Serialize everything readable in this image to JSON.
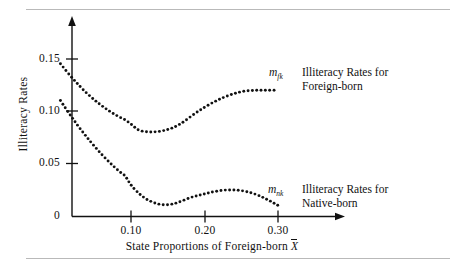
{
  "figure": {
    "background": "#ffffff",
    "ink_color": "#111111",
    "rule_color": "#b9b9b9",
    "top_rule": "divider-line",
    "bottom_rule": "divider-line"
  },
  "axes": {
    "x_tick_labels": [
      "0.10",
      "0.20",
      "0.30"
    ],
    "x_tick_values": [
      0.1,
      0.2,
      0.3
    ],
    "y_tick_labels": [
      "0",
      "0.05",
      "0.10",
      "0.15"
    ],
    "y_tick_values": [
      0,
      0.05,
      0.1,
      0.15
    ],
    "x_axis_title_prefix": "State Proportions of Foreign-born ",
    "x_axis_title_symbol": "X",
    "y_axis_title": "Illiteracy Rates",
    "x_arrow": "right-arrow-head",
    "y_arrow": "up-arrow-head"
  },
  "annotations": {
    "foreign": {
      "symbol_base": "m",
      "symbol_sub": "fk",
      "line1": "Illiteracy Rates for",
      "line2": "Foreign-born"
    },
    "native": {
      "symbol_base": "m",
      "symbol_sub": "nk",
      "line1": "Illiteracy Rates for",
      "line2": "Native-born"
    }
  },
  "chart_data": {
    "type": "line",
    "title": "",
    "subtitle": "",
    "xlabel": "State Proportions of Foreign-born X̄",
    "ylabel": "Illiteracy Rates",
    "xlim": [
      0.0,
      0.335
    ],
    "ylim": [
      0.0,
      0.175
    ],
    "xticks": [
      0.1,
      0.2,
      0.3
    ],
    "yticks": [
      0,
      0.05,
      0.1,
      0.15
    ],
    "grid": false,
    "legend_position": "inline-right-annotations",
    "marker_style": "dotted",
    "series": [
      {
        "name": "m_fk — Illiteracy Rates for Foreign-born",
        "x": [
          0.004,
          0.012,
          0.02,
          0.028,
          0.036,
          0.044,
          0.052,
          0.06,
          0.068,
          0.076,
          0.084,
          0.092,
          0.1,
          0.11,
          0.12,
          0.13,
          0.14,
          0.15,
          0.16,
          0.17,
          0.18,
          0.19,
          0.2,
          0.21,
          0.22,
          0.23,
          0.24,
          0.25,
          0.26,
          0.27,
          0.28,
          0.29,
          0.3
        ],
        "y": [
          0.1455,
          0.1385,
          0.132,
          0.1258,
          0.12,
          0.1148,
          0.11,
          0.1056,
          0.1016,
          0.098,
          0.0948,
          0.092,
          0.088,
          0.0825,
          0.0808,
          0.0805,
          0.0812,
          0.0828,
          0.0855,
          0.0895,
          0.0945,
          0.0995,
          0.104,
          0.108,
          0.1115,
          0.1145,
          0.117,
          0.1188,
          0.1198,
          0.1202,
          0.1203,
          0.1203,
          0.1203
        ]
      },
      {
        "name": "m_nk — Illiteracy Rates for Native-born",
        "x": [
          0.004,
          0.012,
          0.02,
          0.028,
          0.036,
          0.044,
          0.052,
          0.06,
          0.068,
          0.076,
          0.084,
          0.092,
          0.1,
          0.11,
          0.12,
          0.13,
          0.14,
          0.15,
          0.16,
          0.17,
          0.18,
          0.19,
          0.2,
          0.21,
          0.22,
          0.23,
          0.24,
          0.25,
          0.26,
          0.27,
          0.28,
          0.29,
          0.3
        ],
        "y": [
          0.1105,
          0.102,
          0.094,
          0.0862,
          0.079,
          0.072,
          0.0655,
          0.0592,
          0.0535,
          0.048,
          0.043,
          0.0385,
          0.03,
          0.0225,
          0.017,
          0.0135,
          0.0115,
          0.0112,
          0.0125,
          0.015,
          0.0178,
          0.0198,
          0.0215,
          0.0232,
          0.0245,
          0.0252,
          0.0252,
          0.0246,
          0.0232,
          0.021,
          0.018,
          0.0145,
          0.0105
        ]
      }
    ]
  }
}
